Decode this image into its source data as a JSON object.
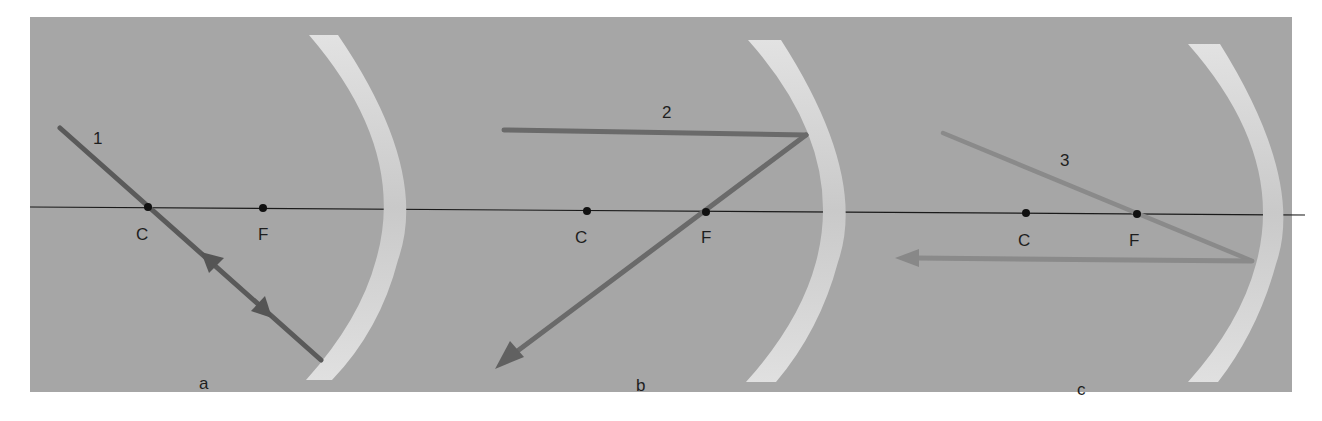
{
  "figure": {
    "colors": {
      "page": "#ffffff",
      "panel": "#a6a6a6",
      "mirror": "#dcdcdc",
      "axis": "#1a1a1a",
      "ray1": "#5a5a5a",
      "ray2": "#6a6a6a",
      "ray3": "#8a8a8a",
      "point": "#111111"
    },
    "panels": [
      {
        "id": "a",
        "caption": "a",
        "ray_label": "1",
        "points": [
          {
            "label": "C",
            "x": 148
          },
          {
            "label": "F",
            "x": 263
          }
        ],
        "description": "Ray through center of curvature reflects back on itself"
      },
      {
        "id": "b",
        "caption": "b",
        "ray_label": "2",
        "points": [
          {
            "label": "C",
            "x": 587
          },
          {
            "label": "F",
            "x": 706
          }
        ],
        "description": "Ray parallel to axis reflects through focal point"
      },
      {
        "id": "c",
        "caption": "c",
        "ray_label": "3",
        "points": [
          {
            "label": "C",
            "x": 1026
          },
          {
            "label": "F",
            "x": 1137
          }
        ],
        "description": "Ray through focal point reflects parallel to axis"
      }
    ]
  }
}
